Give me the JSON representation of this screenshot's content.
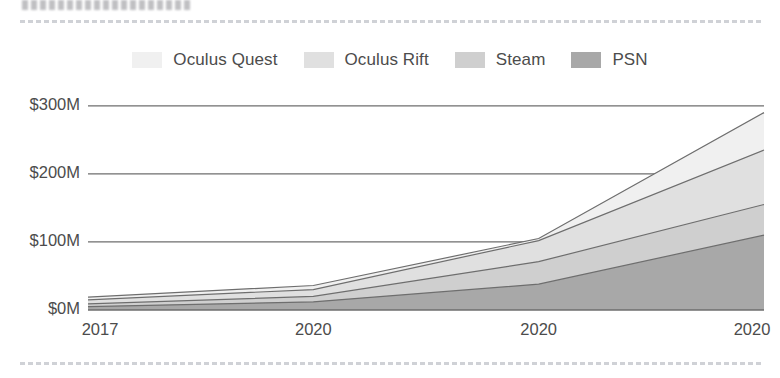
{
  "page": {
    "background_color": "#ffffff",
    "header_artifact_label": "blurred-text-line",
    "rule_label": "faint-dashed-rule"
  },
  "legend": {
    "position": "top-center",
    "items": [
      {
        "label": "Oculus Quest",
        "color": "#f0f0f0",
        "swatch_name": "legend-swatch-oculus-quest"
      },
      {
        "label": "Oculus Rift",
        "color": "#e0e0e0",
        "swatch_name": "legend-swatch-oculus-rift"
      },
      {
        "label": "Steam",
        "color": "#cfcfcf",
        "swatch_name": "legend-swatch-steam"
      },
      {
        "label": "PSN",
        "color": "#a8a8a8",
        "swatch_name": "legend-swatch-psn"
      }
    ]
  },
  "axes": {
    "y_ticks": [
      "$300M",
      "$200M",
      "$100M",
      "$0M"
    ],
    "x_ticks": [
      "2017",
      "2020",
      "2020",
      "2020"
    ]
  },
  "chart_data": {
    "type": "area",
    "stacked": true,
    "title": "",
    "subtitle": "",
    "xlabel": "",
    "ylabel": "",
    "categories": [
      "2017",
      "2020",
      "2020",
      "2020"
    ],
    "x_tick_labels": [
      "2017",
      "2020",
      "2020",
      "2020"
    ],
    "y_tick_labels": [
      "$0M",
      "$100M",
      "$200M",
      "$300M"
    ],
    "y_tick_values": [
      0,
      100,
      200,
      300
    ],
    "ylim": [
      0,
      310
    ],
    "y_unit": "millions USD",
    "grid": "horizontal",
    "legend_position": "top-center",
    "series": [
      {
        "name": "PSN",
        "color": "#a8a8a8",
        "values": [
          5,
          12,
          38,
          110
        ]
      },
      {
        "name": "Steam",
        "color": "#cfcfcf",
        "values": [
          4,
          8,
          33,
          45
        ]
      },
      {
        "name": "Oculus Rift",
        "color": "#e0e0e0",
        "values": [
          6,
          10,
          31,
          80
        ]
      },
      {
        "name": "Oculus Quest",
        "color": "#f0f0f0",
        "values": [
          4,
          6,
          3,
          55
        ]
      }
    ],
    "cumulative_totals": [
      19,
      36,
      105,
      290
    ],
    "annotations": [
      {
        "text": "series converge near $105M at third tick",
        "x_index": 2,
        "y_value": 105
      }
    ]
  }
}
